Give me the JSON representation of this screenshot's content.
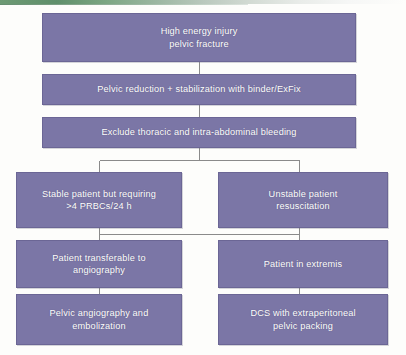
{
  "diagram": {
    "type": "flowchart",
    "colors": {
      "node_fill": "#7b76a6",
      "node_border": "#6b6695",
      "node_text": "#ffffff",
      "connector": "#8a8a8a",
      "background": "#fdfdfb",
      "accent_strip": "#6d9a74"
    },
    "nodes": [
      {
        "id": "n1",
        "name": "high-energy-injury",
        "text": "High energy injury\npelvic fracture",
        "column": "full",
        "row": 1
      },
      {
        "id": "n2",
        "name": "pelvic-reduction",
        "text": "Pelvic reduction + stabilization with binder/ExFix",
        "column": "full",
        "row": 2
      },
      {
        "id": "n3",
        "name": "exclude-bleeding",
        "text": "Exclude thoracic and intra-abdominal bleeding",
        "column": "full",
        "row": 3
      },
      {
        "id": "n4",
        "name": "stable-patient",
        "text": "Stable patient but requiring\n>4 PRBCs/24 h",
        "column": "left",
        "row": 4
      },
      {
        "id": "n5",
        "name": "unstable-patient",
        "text": "Unstable patient\nresuscitation",
        "column": "right",
        "row": 4
      },
      {
        "id": "n6",
        "name": "patient-transferable",
        "text": "Patient transferable to\nangiography",
        "column": "left",
        "row": 5
      },
      {
        "id": "n7",
        "name": "patient-in-extremis",
        "text": "Patient in extremis",
        "column": "right",
        "row": 5
      },
      {
        "id": "n8",
        "name": "pelvic-angiography",
        "text": "Pelvic angiography and\nembolization",
        "column": "left",
        "row": 6
      },
      {
        "id": "n9",
        "name": "dcs-packing",
        "text": "DCS with extraperitoneal\npelvic packing",
        "column": "right",
        "row": 6
      }
    ],
    "edges": [
      {
        "from": "n1",
        "to": "n2",
        "style": "vertical"
      },
      {
        "from": "n2",
        "to": "n3",
        "style": "vertical"
      },
      {
        "from": "n3",
        "to": "n4",
        "style": "split-left"
      },
      {
        "from": "n3",
        "to": "n5",
        "style": "split-right"
      },
      {
        "from": "n4",
        "to": "n6",
        "style": "vertical"
      },
      {
        "from": "n5",
        "to": "n7",
        "style": "vertical"
      },
      {
        "from": "n4",
        "to": "n7",
        "style": "cross-link"
      },
      {
        "from": "n6",
        "to": "n8",
        "style": "vertical"
      },
      {
        "from": "n7",
        "to": "n9",
        "style": "vertical"
      }
    ]
  }
}
